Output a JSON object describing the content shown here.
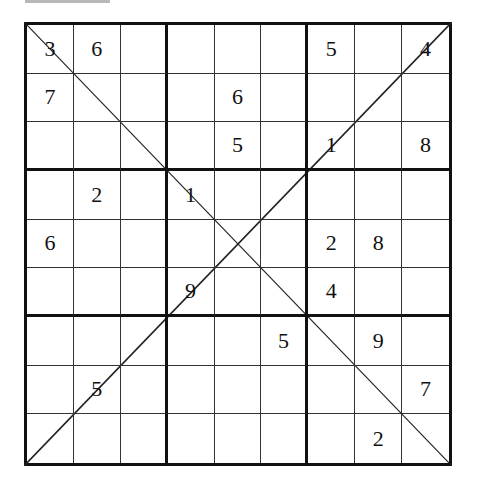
{
  "puzzle": {
    "type": "diagonal-sudoku",
    "size": 9,
    "box_size": 3,
    "diagonals": [
      "main",
      "anti"
    ],
    "grid": [
      [
        "3",
        "6",
        "",
        "",
        "",
        "",
        "5",
        "",
        "4"
      ],
      [
        "7",
        "",
        "",
        "",
        "6",
        "",
        "",
        "",
        ""
      ],
      [
        "",
        "",
        "",
        "",
        "5",
        "",
        "1",
        "",
        "8"
      ],
      [
        "",
        "2",
        "",
        "1",
        "",
        "",
        "",
        "",
        ""
      ],
      [
        "6",
        "",
        "",
        "",
        "",
        "",
        "2",
        "8",
        ""
      ],
      [
        "",
        "",
        "",
        "9",
        "",
        "",
        "4",
        "",
        ""
      ],
      [
        "",
        "",
        "",
        "",
        "",
        "5",
        "",
        "9",
        ""
      ],
      [
        "",
        "5",
        "",
        "",
        "",
        "",
        "",
        "",
        "7"
      ],
      [
        "",
        "",
        "",
        "",
        "",
        "",
        "",
        "2",
        ""
      ]
    ]
  },
  "colors": {
    "background": "#ffffff",
    "grid_line": "#111111",
    "digit": "#111111"
  }
}
